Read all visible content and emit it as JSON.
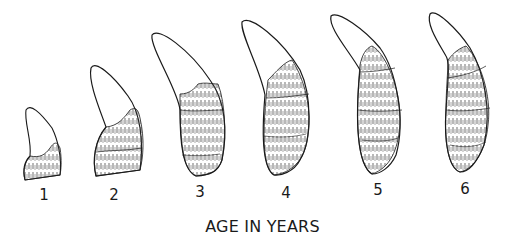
{
  "figure": {
    "caption": "AGE IN YEARS",
    "teeth": [
      {
        "label": "1",
        "x": 44
      },
      {
        "label": "2",
        "x": 114
      },
      {
        "label": "3",
        "x": 200
      },
      {
        "label": "4",
        "x": 286
      },
      {
        "label": "5",
        "x": 378
      },
      {
        "label": "6",
        "x": 465
      }
    ]
  },
  "colors": {
    "ink": "#1a1a1a",
    "background": "#ffffff"
  }
}
